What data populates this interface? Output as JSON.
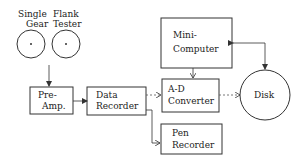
{
  "diagram": {
    "tester": {
      "label_left": "Single",
      "label_left_2": "Gear",
      "label_right": "Flank",
      "label_right_2": "Tester"
    },
    "blocks": {
      "preamp": {
        "line1": "Pre-",
        "line2": "Amp."
      },
      "data_recorder": {
        "line1": "Data",
        "line2": "Recorder"
      },
      "minicomputer": {
        "line1": "Mini-",
        "line2": "Computer"
      },
      "ad_converter": {
        "line1": "A-D",
        "line2": "Converter"
      },
      "pen_recorder": {
        "line1": "Pen",
        "line2": "Recorder"
      },
      "disk": {
        "label": "Disk"
      }
    },
    "connections": [
      {
        "from": "Single Gear Flank Tester",
        "to": "Pre-Amp.",
        "style": "solid"
      },
      {
        "from": "Pre-Amp.",
        "to": "Data Recorder",
        "style": "solid"
      },
      {
        "from": "Data Recorder",
        "to": "A-D Converter",
        "style": "dashed"
      },
      {
        "from": "Data Recorder",
        "to": "Pen Recorder",
        "style": "solid"
      },
      {
        "from": "Mini-Computer",
        "to": "A-D Converter",
        "style": "solid"
      },
      {
        "from": "A-D Converter",
        "to": "Disk",
        "style": "dashed"
      },
      {
        "from": "Mini-Computer",
        "to": "Disk",
        "style": "solid-bidirectional"
      }
    ],
    "colors": {
      "line": "#333333",
      "background": "#ffffff"
    }
  }
}
